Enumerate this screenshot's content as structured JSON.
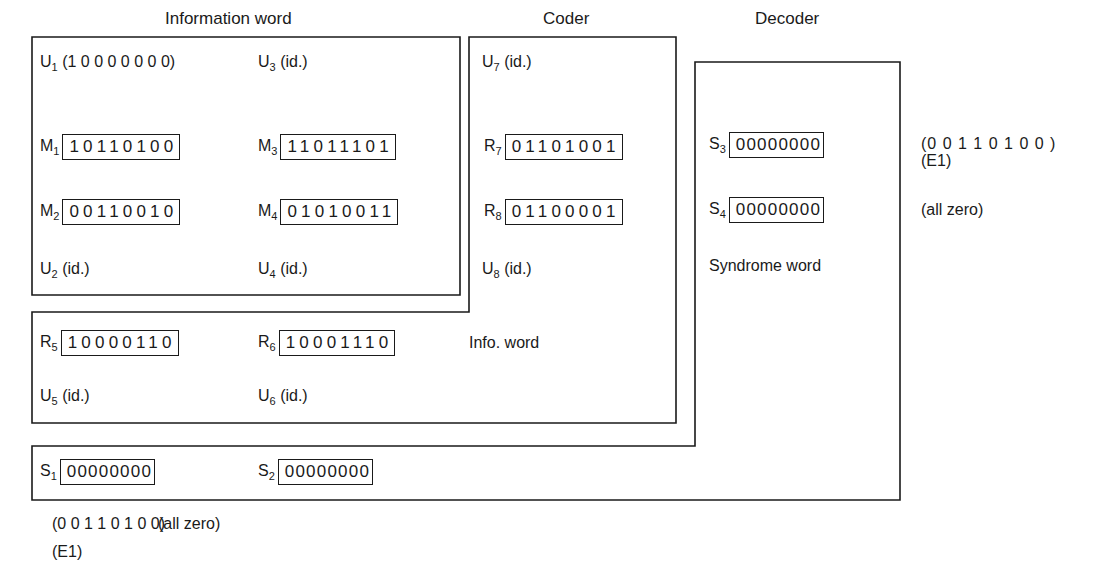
{
  "headers": {
    "information_word": "Information word",
    "coder": "Coder",
    "decoder": "Decoder"
  },
  "information_block": {
    "u1": {
      "name": "U",
      "sub": "1",
      "text": "(1 0 0 0 0 0 0 0)"
    },
    "u3": {
      "name": "U",
      "sub": "3",
      "text": "(id.)"
    },
    "m1": {
      "name": "M",
      "sub": "1",
      "bits": "10110100"
    },
    "m3": {
      "name": "M",
      "sub": "3",
      "bits": "11011101"
    },
    "m2": {
      "name": "M",
      "sub": "2",
      "bits": "00110010"
    },
    "m4": {
      "name": "M",
      "sub": "4",
      "bits": "01010011"
    },
    "u2": {
      "name": "U",
      "sub": "2",
      "text": "(id.)"
    },
    "u4": {
      "name": "U",
      "sub": "4",
      "text": "(id.)"
    }
  },
  "coder_block": {
    "u7": {
      "name": "U",
      "sub": "7",
      "text": "(id.)"
    },
    "r7": {
      "name": "R",
      "sub": "7",
      "bits": "01101001"
    },
    "r8": {
      "name": "R",
      "sub": "8",
      "bits": "01100001"
    },
    "u8": {
      "name": "U",
      "sub": "8",
      "text": "(id.)"
    },
    "r5": {
      "name": "R",
      "sub": "5",
      "bits": "10000110"
    },
    "r6": {
      "name": "R",
      "sub": "6",
      "bits": "10001110"
    },
    "info_word_label": "Info. word",
    "u5": {
      "name": "U",
      "sub": "5",
      "text": "(id.)"
    },
    "u6": {
      "name": "U",
      "sub": "6",
      "text": "(id.)"
    }
  },
  "decoder_block": {
    "s3": {
      "name": "S",
      "sub": "3",
      "bits": "00000000"
    },
    "s3_note": "(0 0 1 1 0 1 0 0 )",
    "s3_note2": "(E1)",
    "s4": {
      "name": "S",
      "sub": "4",
      "bits": "00000000"
    },
    "s4_note": "(all zero)",
    "syndrome_label": "Syndrome word",
    "s1": {
      "name": "S",
      "sub": "1",
      "bits": "00000000"
    },
    "s2": {
      "name": "S",
      "sub": "2",
      "bits": "00000000"
    },
    "s1_note": "(0 0 1 1 0 1 0 0)",
    "s1_note2": "(E1)",
    "s2_note": "(all zero)"
  }
}
